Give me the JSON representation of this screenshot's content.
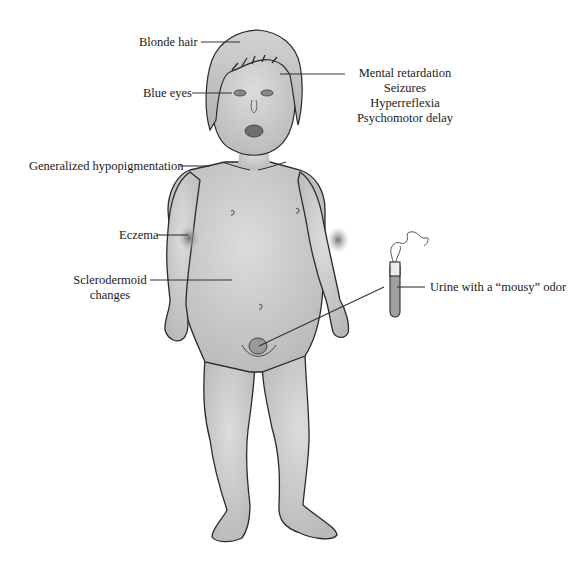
{
  "figure": {
    "colors": {
      "skin": "#cfcfcf",
      "skin_shadow": "#a9a9a9",
      "outline": "#2a2a2a",
      "leader_line": "#333333",
      "text": "#1a1a1a",
      "background": "#ffffff"
    }
  },
  "labels": {
    "blonde_hair": "Blonde hair",
    "blue_eyes": "Blue eyes",
    "neuro": [
      "Mental retardation",
      "Seizures",
      "Hyperreflexia",
      "Psychomotor delay"
    ],
    "hypopigmentation": "Generalized hypopigmentation",
    "eczema": "Eczema",
    "sclerodermoid": [
      "Sclerodermoid",
      "changes"
    ],
    "urine": "Urine with a “mousy” odor"
  }
}
